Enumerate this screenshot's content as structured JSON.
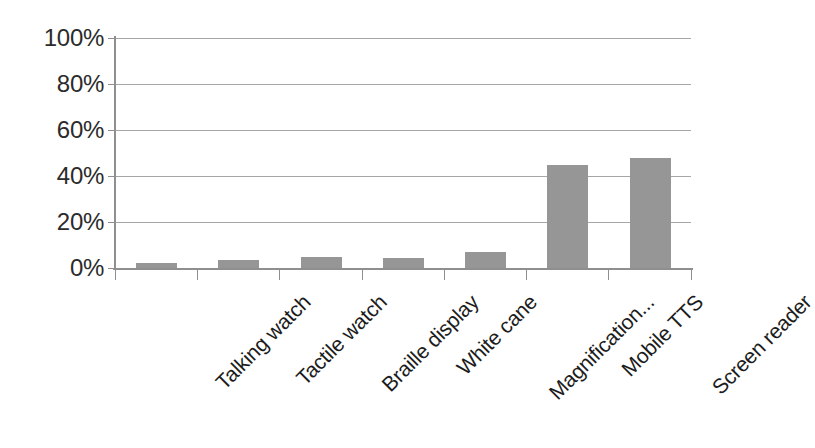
{
  "chart_data": {
    "type": "bar",
    "title": "",
    "subtitle": "",
    "xlabel": "",
    "ylabel": "",
    "categories": [
      "Talking watch",
      "Tactile watch",
      "Braille display",
      "White cane",
      "Magnification...",
      "Mobile TTS",
      "Screen reader"
    ],
    "values": [
      2,
      3.5,
      5,
      4.5,
      7,
      45,
      48
    ],
    "value_suffix": "%",
    "ylim": [
      0,
      100
    ],
    "ytick_values": [
      0,
      20,
      40,
      60,
      80,
      100
    ],
    "ytick_labels": [
      "0%",
      "20%",
      "40%",
      "60%",
      "80%",
      "100%"
    ],
    "grid": true,
    "grid_axis": "y",
    "legend": false,
    "legend_position": "none",
    "bar_color": "#969696",
    "gridline_color": "#a6a6a6",
    "axis_color": "#8f8f8f",
    "label_color": "#1c1c1c",
    "background_color": "#ffffff",
    "xtick_label_rotation": -45
  }
}
